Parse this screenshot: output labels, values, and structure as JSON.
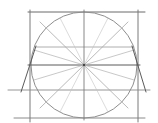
{
  "diagram": {
    "title": "",
    "colors": {
      "background": "#ffffff",
      "stroke": "#8a8a8a",
      "stroke_dark": "#5a5a5a",
      "stroke_light": "#bdbdbd"
    },
    "shapes": {
      "square": {
        "x": 30,
        "y": 12,
        "w": 112,
        "h": 106
      },
      "circle": {
        "cx": 84,
        "cy": 65,
        "r": 53
      }
    }
  }
}
